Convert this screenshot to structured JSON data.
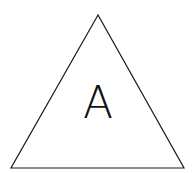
{
  "diagram": {
    "shape": "triangle",
    "vertices": {
      "apex": [
        98,
        15
      ],
      "bottom_left": [
        11,
        168
      ],
      "bottom_right": [
        184,
        168
      ]
    },
    "stroke_color": "#1a1a1a",
    "fill_color": "#ffffff",
    "label": {
      "text": "A",
      "x": 98,
      "y": 118,
      "color": "#111111"
    }
  }
}
